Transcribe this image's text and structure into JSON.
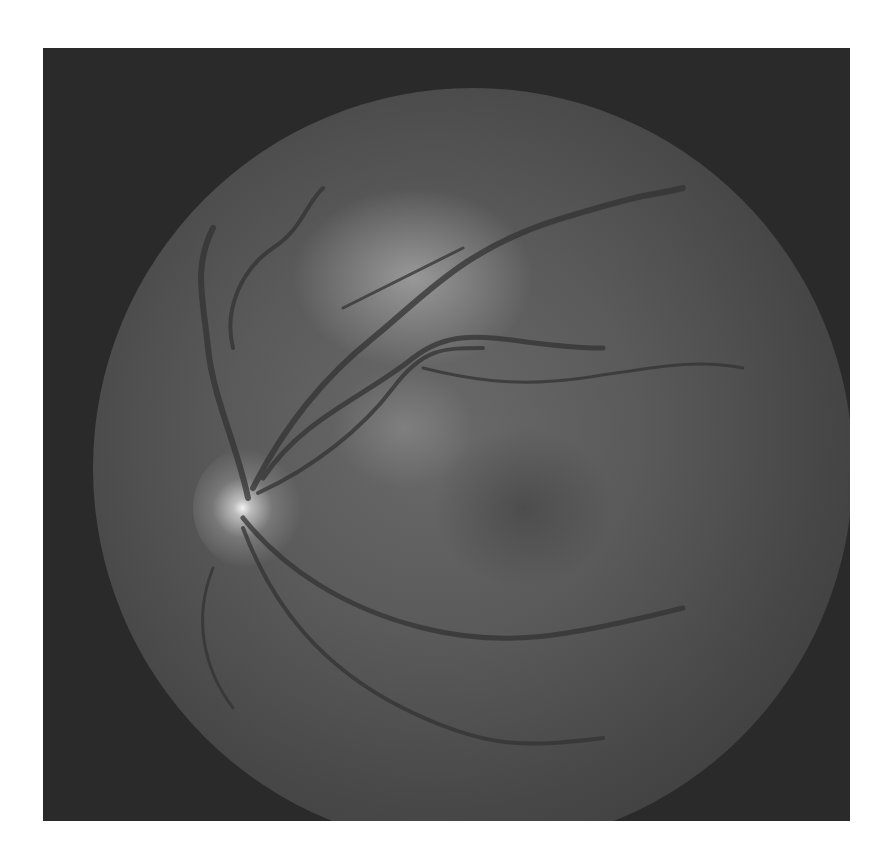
{
  "image": {
    "subject": "retinal fundus photograph",
    "mode": "grayscale",
    "colors": {
      "border": "#ffffff",
      "background": "#2a2a2a",
      "fundus_center": "#6a6a6a",
      "fundus_edge": "#353535",
      "optic_disc_highlight": "#f2f2f2",
      "vessel": "#3a3a3a"
    }
  }
}
